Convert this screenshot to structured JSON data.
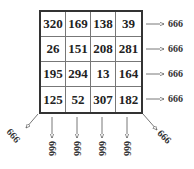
{
  "diagram": {
    "magic_constant": "666",
    "grid": [
      [
        "320",
        "169",
        "138",
        "39"
      ],
      [
        "26",
        "151",
        "208",
        "281"
      ],
      [
        "195",
        "294",
        "13",
        "164"
      ],
      [
        "125",
        "52",
        "307",
        "182"
      ]
    ],
    "row_sums": [
      "666",
      "666",
      "666",
      "666"
    ],
    "column_sums": [
      "666",
      "666",
      "666",
      "666"
    ],
    "diagonal_sums": {
      "anti_diagonal": "666",
      "main_diagonal": "666"
    }
  }
}
